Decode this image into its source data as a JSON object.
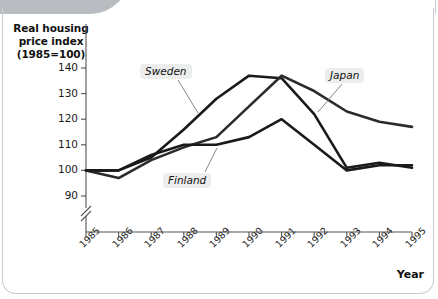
{
  "chart_data": {
    "type": "line",
    "title": "Real housing price index (1985=100)",
    "ylabel_lines": [
      "Real housing",
      "price index",
      "(1985=100)"
    ],
    "xlabel": "Year",
    "ylabel": "Real housing price index (1985=100)",
    "categories": [
      "1985",
      "1986",
      "1987",
      "1988",
      "1989",
      "1990",
      "1991",
      "1992",
      "1993",
      "1994",
      "1995"
    ],
    "x": [
      1985,
      1986,
      1987,
      1988,
      1989,
      1990,
      1991,
      1992,
      1993,
      1994,
      1995
    ],
    "yticks": [
      90,
      100,
      110,
      120,
      130,
      140
    ],
    "ytick_labels": [
      "90",
      "100",
      "110",
      "120",
      "130",
      "140"
    ],
    "ylim": [
      86,
      143
    ],
    "xlim": [
      1985,
      1995
    ],
    "axis_break": true,
    "grid": false,
    "legend": "inline-annotations",
    "series": [
      {
        "name": "Sweden",
        "color": "#1a1a1a",
        "values": [
          100,
          100,
          105,
          116,
          128,
          137,
          136,
          122,
          101,
          103,
          101
        ]
      },
      {
        "name": "Japan",
        "color": "#2b2b2b",
        "values": [
          100,
          97,
          104,
          109,
          113,
          125,
          137,
          131,
          123,
          119,
          117
        ]
      },
      {
        "name": "Finland",
        "color": "#1a1a1a",
        "values": [
          100,
          100,
          106,
          110,
          110,
          113,
          120,
          110,
          100,
          102,
          102
        ]
      }
    ]
  },
  "annotations": [
    {
      "text": "Sweden",
      "x": 140,
      "y": 64
    },
    {
      "text": "Finland",
      "x": 163,
      "y": 173
    },
    {
      "text": "Japan",
      "x": 325,
      "y": 68
    }
  ],
  "axis": {
    "y_title_lines": [
      "Real housing",
      "price index",
      "(1985=100)"
    ],
    "x_title": "Year"
  }
}
